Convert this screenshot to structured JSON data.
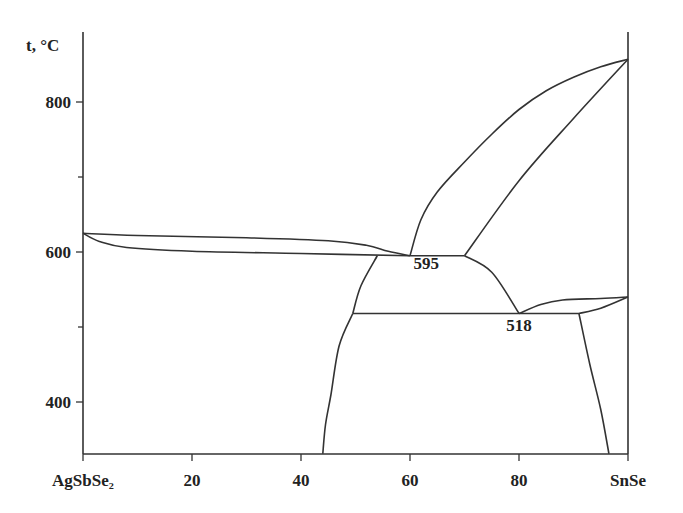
{
  "chart_data": {
    "type": "line",
    "title": "",
    "subtitle": "Phase diagram AgSbSe2 – SnSe",
    "ylabel": "t, °C",
    "xlabel": "",
    "x_tick_labels": [
      "AgSbSe₂",
      "20",
      "40",
      "60",
      "80",
      "SnSe"
    ],
    "x_ticks": [
      0,
      20,
      40,
      60,
      80,
      100
    ],
    "y_tick_labels": [
      "800",
      "600",
      "400"
    ],
    "y_ticks": [
      800,
      600,
      400
    ],
    "y_minor_ticks": [
      700,
      500
    ],
    "xlim": [
      0,
      100
    ],
    "ylim": [
      331,
      900
    ],
    "grid": false,
    "legend": null,
    "annotations": [
      {
        "text": "595",
        "x": 63,
        "y": 577
      },
      {
        "text": "518",
        "x": 80,
        "y": 495
      }
    ],
    "series": [
      {
        "name": "liquidus-left",
        "points": [
          [
            0,
            625
          ],
          [
            10,
            622
          ],
          [
            30,
            619
          ],
          [
            45,
            615
          ],
          [
            52,
            609
          ],
          [
            56,
            601
          ],
          [
            60,
            595
          ]
        ]
      },
      {
        "name": "solidus-left",
        "points": [
          [
            0,
            625
          ],
          [
            3,
            614
          ],
          [
            8,
            606
          ],
          [
            20,
            601
          ],
          [
            40,
            598
          ],
          [
            60,
            595
          ]
        ]
      },
      {
        "name": "liquidus-right",
        "points": [
          [
            60,
            595
          ],
          [
            62,
            643
          ],
          [
            65,
            680
          ],
          [
            70,
            720
          ],
          [
            75,
            757
          ],
          [
            80,
            790
          ],
          [
            85,
            815
          ],
          [
            90,
            833
          ],
          [
            95,
            847
          ],
          [
            100,
            857
          ]
        ]
      },
      {
        "name": "solidus-right",
        "points": [
          [
            70,
            595
          ],
          [
            80,
            695
          ],
          [
            90,
            778
          ],
          [
            100,
            857
          ]
        ]
      },
      {
        "name": "eutectic-595",
        "points": [
          [
            60,
            595
          ],
          [
            70,
            595
          ]
        ]
      },
      {
        "name": "boundary-595-518",
        "points": [
          [
            70,
            595
          ],
          [
            75,
            573
          ],
          [
            80,
            518
          ]
        ]
      },
      {
        "name": "solvus-left-upper",
        "points": [
          [
            54,
            595
          ],
          [
            51,
            555
          ],
          [
            49.5,
            518
          ]
        ]
      },
      {
        "name": "solvus-left-lower",
        "points": [
          [
            49.5,
            518
          ],
          [
            47,
            475
          ],
          [
            45.5,
            410
          ],
          [
            44.5,
            370
          ],
          [
            44,
            331
          ]
        ]
      },
      {
        "name": "peritectic-518",
        "points": [
          [
            49.5,
            518
          ],
          [
            91,
            518
          ]
        ]
      },
      {
        "name": "upper-right-curve",
        "points": [
          [
            80,
            518
          ],
          [
            84,
            530
          ],
          [
            88,
            536
          ],
          [
            95,
            538
          ],
          [
            100,
            540
          ]
        ]
      },
      {
        "name": "lower-right-curve",
        "points": [
          [
            91,
            518
          ],
          [
            95,
            525
          ],
          [
            100,
            540
          ]
        ]
      },
      {
        "name": "solvus-right",
        "points": [
          [
            91,
            518
          ],
          [
            93,
            450
          ],
          [
            95,
            390
          ],
          [
            96.5,
            331
          ]
        ]
      }
    ]
  }
}
